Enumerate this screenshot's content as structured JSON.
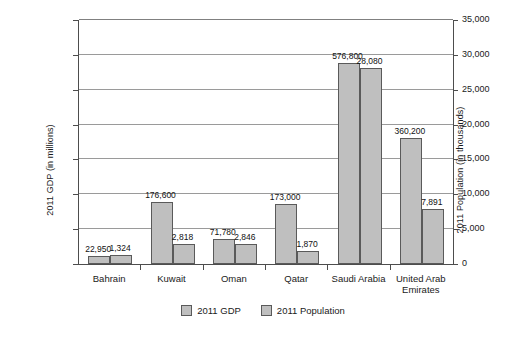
{
  "chart_data": {
    "type": "bar",
    "title": "",
    "xlabel": "",
    "categories": [
      "Bahrain",
      "Kuwait",
      "Oman",
      "Qatar",
      "Saudi Arabia",
      "United Arab Emirates"
    ],
    "series": [
      {
        "name": "2011 GDP",
        "axis": "left",
        "ylabel": "2011 GDP (in millions)",
        "ylim": [
          0,
          700000
        ],
        "yticks": [
          "0",
          "100,000",
          "200,000",
          "300,000",
          "400,000",
          "500,000",
          "600,000",
          "700,000"
        ],
        "values": [
          22950,
          176600,
          71780,
          173000,
          576800,
          360200
        ],
        "labels": [
          "22,950",
          "176,600",
          "71,780",
          "173,000",
          "576,800",
          "360,200"
        ],
        "color": "#bfbfbf"
      },
      {
        "name": "2011 Population",
        "axis": "right",
        "ylabel": "2011 Population (in thousands)",
        "ylim": [
          0,
          35000
        ],
        "yticks": [
          "0",
          "5,000",
          "10,000",
          "15,000",
          "20,000",
          "25,000",
          "30,000",
          "35,000"
        ],
        "values": [
          1324,
          2818,
          2846,
          1870,
          28080,
          7891
        ],
        "labels": [
          "1,324",
          "2,818",
          "2,846",
          "1,870",
          "28,080",
          "7,891"
        ],
        "color": "#bfbfbf"
      }
    ],
    "grid": true,
    "legend_position": "bottom",
    "legend_entries": [
      "2011 GDP",
      "2011 Population"
    ]
  },
  "axes": {
    "left_title": "2011 GDP (in millions)",
    "right_title": "2011 Population (in thousands)"
  },
  "colors": {
    "bar_fill": "#bfbfbf",
    "bar_border": "#5a5a5a",
    "gridline": "#9a9a9a",
    "axis": "#4d4d4d",
    "text": "#1a1a1a",
    "background": "#ffffff"
  }
}
